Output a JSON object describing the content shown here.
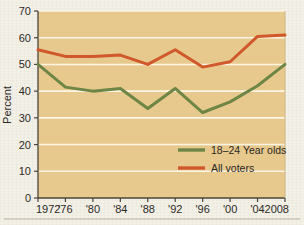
{
  "chart_data": {
    "type": "line",
    "title": "",
    "xlabel": "",
    "ylabel": "Percent",
    "ylim": [
      0,
      70
    ],
    "ytick_step": 10,
    "grid": true,
    "legend_position": "inside-lower-right",
    "categories": [
      "1972",
      "'76",
      "'80",
      "'84",
      "'88",
      "'92",
      "'96",
      "'00",
      "'04",
      "2008"
    ],
    "x_values": [
      1972,
      1976,
      1980,
      1984,
      1988,
      1992,
      1996,
      2000,
      2004,
      2008
    ],
    "yticks": [
      "0",
      "10",
      "20",
      "30",
      "40",
      "50",
      "60",
      "70"
    ],
    "series": [
      {
        "name": "18–24 Year olds",
        "color": "#6d8545",
        "values": [
          50.0,
          41.5,
          40.0,
          41.0,
          33.5,
          41.0,
          32.0,
          36.0,
          42.0,
          50.0
        ]
      },
      {
        "name": "All voters",
        "color": "#d0582a",
        "values": [
          55.5,
          53.0,
          53.0,
          53.5,
          50.0,
          55.5,
          49.0,
          51.0,
          60.5,
          61.0
        ]
      }
    ],
    "colors": {
      "plot_background": "#e7c98d",
      "gridline": "#fbf5e6",
      "axis": "#4a443c",
      "page_background": "#f2efe6",
      "series_18_24": "#6d8545",
      "series_all_voters": "#d0582a"
    }
  },
  "legend": {
    "items": [
      {
        "label": "18–24 Year olds",
        "color": "#6d8545"
      },
      {
        "label": "All voters",
        "color": "#d0582a"
      }
    ]
  },
  "axes": {
    "y_title": "Percent",
    "y_ticks": [
      "70",
      "60",
      "50",
      "40",
      "30",
      "20",
      "10",
      "0"
    ],
    "x_ticks": [
      "1972",
      "'76",
      "'80",
      "'84",
      "'88",
      "'92",
      "'96",
      "'00",
      "'04",
      "2008"
    ]
  }
}
